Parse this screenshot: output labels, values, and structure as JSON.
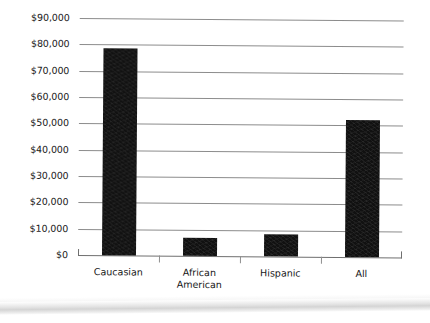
{
  "chart_data": {
    "type": "bar",
    "title": "",
    "subtitle": "",
    "xlabel": "",
    "ylabel": "",
    "categories": [
      "Caucasian",
      "African\nAmerican",
      "Hispanic",
      "All"
    ],
    "values": [
      78800,
      6800,
      8200,
      52000
    ],
    "ylim": [
      0,
      90000
    ],
    "ytick_values": [
      0,
      10000,
      20000,
      30000,
      40000,
      50000,
      60000,
      70000,
      80000,
      90000
    ],
    "ytick_labels": [
      "$0",
      "$10,000",
      "$20,000",
      "$30,000",
      "$40,000",
      "$50,000",
      "$60,000",
      "$70,000",
      "$80,000",
      "$90,000"
    ],
    "grid": "horizontal",
    "legend": "none",
    "bar_color": "#111111",
    "gridline_color": "#8c8c8c",
    "annotations": []
  }
}
